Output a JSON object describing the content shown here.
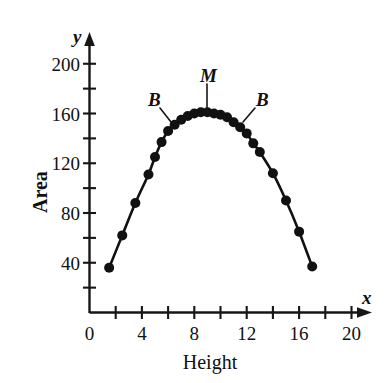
{
  "chart_data": {
    "type": "line",
    "title": "",
    "xlabel": "Height",
    "ylabel": "Area",
    "x_axis_var": "x",
    "y_axis_var": "y",
    "xlim": [
      0,
      21.5
    ],
    "ylim": [
      0,
      215
    ],
    "x_tick_step": 2,
    "y_tick_step": 20,
    "x_ticks": [
      0,
      2,
      4,
      6,
      8,
      10,
      12,
      14,
      16,
      18,
      20
    ],
    "y_ticks": [
      20,
      40,
      60,
      80,
      100,
      120,
      140,
      160,
      180,
      200
    ],
    "x_tick_labels": [
      "0",
      "4",
      "8",
      "12",
      "16",
      "20"
    ],
    "x_tick_label_values": [
      0,
      4,
      8,
      12,
      16,
      20
    ],
    "y_tick_labels": [
      "40",
      "80",
      "120",
      "160",
      "200"
    ],
    "y_tick_label_values": [
      40,
      80,
      120,
      160,
      200
    ],
    "grid": false,
    "legend": "none",
    "markers": "filled-circle",
    "x": [
      1.5,
      2.5,
      3.5,
      4.5,
      5.0,
      5.5,
      6.0,
      6.5,
      7.0,
      7.5,
      8.0,
      8.5,
      9.0,
      9.5,
      10.0,
      10.5,
      11.0,
      11.5,
      12.0,
      12.5,
      13.0,
      14.0,
      15.0,
      16.0,
      17.0
    ],
    "values": [
      36,
      62,
      88,
      111,
      125,
      137,
      146,
      151,
      155,
      158,
      160,
      161,
      161,
      160,
      159,
      157,
      153,
      149,
      144,
      136,
      129,
      112,
      90,
      65,
      37
    ],
    "annotations": [
      {
        "label": "M",
        "at_x": 9.0,
        "at_y": 161,
        "note": "maximum point"
      },
      {
        "label": "B",
        "at_x": 6.0,
        "at_y": 146,
        "note": "left break point"
      },
      {
        "label": "B",
        "at_x": 12.0,
        "at_y": 144,
        "note": "right break point"
      }
    ]
  },
  "labels": {
    "y_axis_variable": "y",
    "x_axis_variable": "x",
    "y_axis_title": "Area",
    "x_axis_title": "Height",
    "annotation_m": "M",
    "annotation_b_left": "B",
    "annotation_b_right": "B"
  },
  "colors": {
    "ink": "#111111",
    "background": "#ffffff"
  }
}
